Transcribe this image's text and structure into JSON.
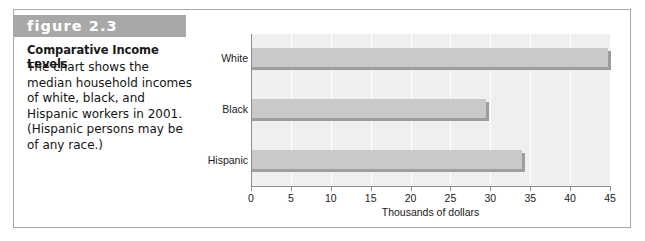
{
  "figure": {
    "band_label": "figure 2.3",
    "title": "Comparative Income Levels",
    "body": "The chart shows the median household incomes of white, black, and Hispanic workers in 2001. (Hispanic persons may be of any race.)",
    "band_color": "#a8a8a8",
    "border_color": "#a9a9a9"
  },
  "chart_data": {
    "type": "bar",
    "orientation": "horizontal",
    "title": "",
    "subtitle": "",
    "categories": [
      "White",
      "Black",
      "Hispanic"
    ],
    "values": [
      44.8,
      29.5,
      34.0
    ],
    "xlabel": "Thousands of dollars",
    "ylabel": "",
    "xlim": [
      0,
      45
    ],
    "xticks": [
      0,
      5,
      10,
      15,
      20,
      25,
      30,
      35,
      40,
      45
    ],
    "xtick_labels": [
      "0",
      "5",
      "10",
      "15",
      "20",
      "25",
      "30",
      "35",
      "40",
      "45"
    ],
    "grid": "vertical-white",
    "legend": "none",
    "plot_background": "#efefef",
    "bar_color": "#c9c9c9",
    "bar_shadow_color": "#9e9e9e",
    "axis_color": "#8f8f8f",
    "units": "thousands of dollars",
    "year": "2001"
  }
}
